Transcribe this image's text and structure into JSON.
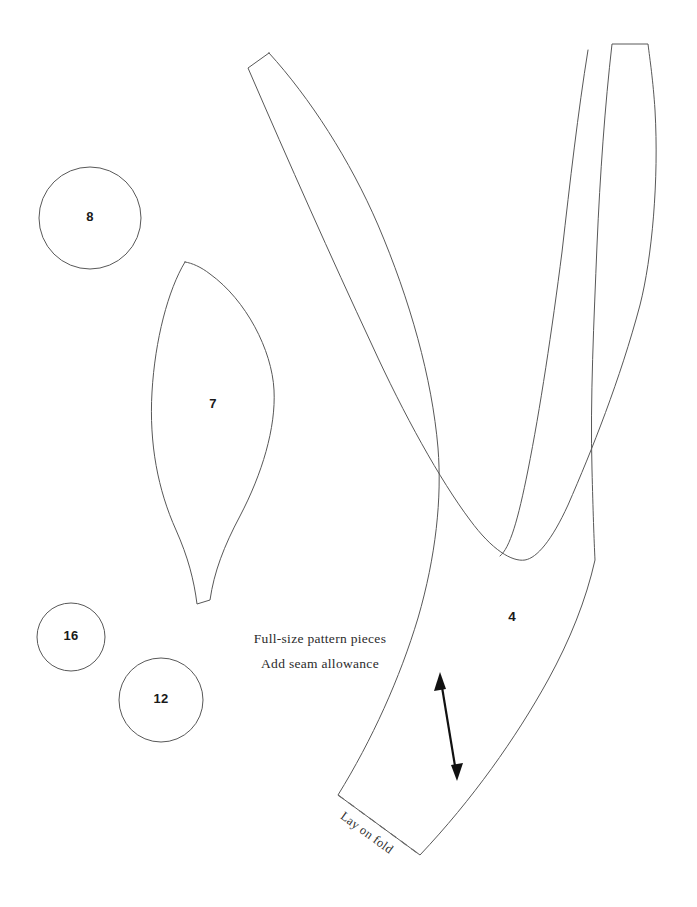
{
  "sheet": {
    "background_color": "#ffffff",
    "line_color": "#585858",
    "ink_color": "#1a1a1a",
    "width": 697,
    "height": 907
  },
  "captions": {
    "line1": "Full-size pattern pieces",
    "line2": "Add seam allowance",
    "fold_label": "Lay on fold"
  },
  "pieces": [
    {
      "id": "circle-8",
      "number": "8",
      "shape": "circle",
      "center_x": 90,
      "center_y": 218,
      "radius": 51
    },
    {
      "id": "circle-16",
      "number": "16",
      "shape": "circle",
      "center_x": 71,
      "center_y": 637,
      "radius": 34
    },
    {
      "id": "circle-12",
      "number": "12",
      "shape": "circle",
      "center_x": 161,
      "center_y": 700,
      "radius": 42
    },
    {
      "id": "petal-7",
      "number": "7",
      "shape": "petal",
      "label_x": 213,
      "label_y": 405
    },
    {
      "id": "bodice-4",
      "number": "4",
      "shape": "strap-bodice",
      "label_x": 512,
      "label_y": 617
    }
  ]
}
